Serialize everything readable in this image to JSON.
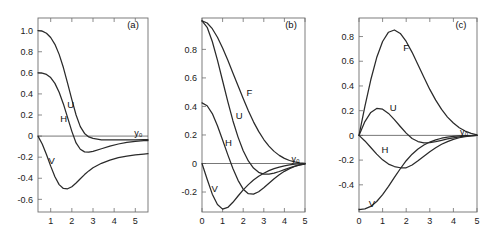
{
  "figure": {
    "background": "#ffffff",
    "curve_color": "#2a2a2a",
    "axis_color": "#6f6f6f",
    "asymptote_label": "y₀"
  },
  "chart_data": [
    {
      "type": "line",
      "panel_tag": "(a)",
      "title": "",
      "xlabel": "",
      "ylabel": "",
      "xlim": [
        0.4,
        5.6
      ],
      "ylim": [
        -0.72,
        1.12
      ],
      "grid": false,
      "legend": "inline-labels",
      "xticks": [
        1,
        2,
        3,
        4,
        5
      ],
      "xticklabels": [
        "1",
        "2",
        "3",
        "4",
        "5"
      ],
      "yticks": [
        1.0,
        0.8,
        0.6,
        0.4,
        0.2,
        0.0,
        -0.2,
        -0.4,
        -0.6
      ],
      "yticklabels": [
        "1.0",
        "0.8",
        "0.6",
        "0.4",
        "0.2",
        "0",
        "-0.2",
        "-0.4",
        "-0.6"
      ],
      "annotations": [
        {
          "text": "U",
          "x": 1.95,
          "y": 0.3
        },
        {
          "text": "H",
          "x": 1.62,
          "y": 0.17
        },
        {
          "text": "V",
          "x": 1.05,
          "y": -0.23
        },
        {
          "text": "y₀",
          "x": 5.15,
          "y": 0.035
        }
      ],
      "series": [
        {
          "name": "U",
          "x": [
            0.4,
            0.6,
            0.8,
            1.0,
            1.2,
            1.4,
            1.6,
            1.8,
            2.0,
            2.2,
            2.4,
            2.6,
            2.8,
            3.0,
            3.4,
            3.8,
            4.2,
            4.6,
            5.0,
            5.4,
            5.6
          ],
          "y": [
            1.0,
            0.995,
            0.975,
            0.935,
            0.87,
            0.775,
            0.65,
            0.5,
            0.345,
            0.2,
            0.09,
            0.025,
            -0.008,
            -0.022,
            -0.035,
            -0.037,
            -0.037,
            -0.036,
            -0.035,
            -0.034,
            -0.034
          ]
        },
        {
          "name": "H",
          "x": [
            0.4,
            0.6,
            0.8,
            1.0,
            1.2,
            1.4,
            1.6,
            1.8,
            2.0,
            2.2,
            2.4,
            2.6,
            2.8,
            3.0,
            3.4,
            3.8,
            4.2,
            4.6,
            5.0,
            5.4,
            5.6
          ],
          "y": [
            0.6,
            0.598,
            0.585,
            0.555,
            0.5,
            0.415,
            0.305,
            0.175,
            0.045,
            -0.065,
            -0.125,
            -0.15,
            -0.152,
            -0.145,
            -0.12,
            -0.095,
            -0.075,
            -0.06,
            -0.05,
            -0.044,
            -0.042
          ]
        },
        {
          "name": "V",
          "x": [
            0.4,
            0.6,
            0.8,
            1.0,
            1.2,
            1.4,
            1.6,
            1.8,
            2.0,
            2.2,
            2.4,
            2.6,
            2.8,
            3.0,
            3.4,
            3.8,
            4.2,
            4.6,
            5.0,
            5.4,
            5.6
          ],
          "y": [
            0.0,
            -0.075,
            -0.175,
            -0.285,
            -0.385,
            -0.46,
            -0.497,
            -0.5,
            -0.48,
            -0.445,
            -0.405,
            -0.365,
            -0.33,
            -0.3,
            -0.258,
            -0.228,
            -0.205,
            -0.19,
            -0.178,
            -0.17,
            -0.167
          ]
        }
      ]
    },
    {
      "type": "line",
      "panel_tag": "(b)",
      "title": "",
      "xlabel": "",
      "ylabel": "",
      "xlim": [
        0.0,
        5.0
      ],
      "ylim": [
        -0.34,
        1.02
      ],
      "grid": false,
      "legend": "inline-labels",
      "xticks": [
        0,
        1,
        2,
        3,
        4,
        5
      ],
      "xticklabels": [
        "0",
        "1",
        "2",
        "3",
        "4",
        "5"
      ],
      "yticks": [
        0.8,
        0.6,
        0.4,
        0.2,
        0.0,
        -0.2
      ],
      "yticklabels": [
        "0.8",
        "0.6",
        "0.4",
        "0.2",
        "0",
        "-0.2"
      ],
      "annotations": [
        {
          "text": "F",
          "x": 2.3,
          "y": 0.5
        },
        {
          "text": "U",
          "x": 1.8,
          "y": 0.335
        },
        {
          "text": "H",
          "x": 1.28,
          "y": 0.145
        },
        {
          "text": "V",
          "x": 0.62,
          "y": -0.175
        },
        {
          "text": "y₀",
          "x": 4.55,
          "y": 0.035
        }
      ],
      "series": [
        {
          "name": "F",
          "x": [
            0.0,
            0.25,
            0.5,
            0.75,
            1.0,
            1.25,
            1.5,
            1.75,
            2.0,
            2.25,
            2.5,
            2.75,
            3.0,
            3.25,
            3.5,
            3.75,
            4.0,
            4.25,
            4.5,
            4.75,
            5.0
          ],
          "y": [
            1.0,
            0.985,
            0.945,
            0.885,
            0.81,
            0.725,
            0.635,
            0.545,
            0.455,
            0.37,
            0.292,
            0.225,
            0.168,
            0.122,
            0.085,
            0.057,
            0.036,
            0.021,
            0.011,
            0.005,
            0.001
          ]
        },
        {
          "name": "U",
          "x": [
            0.0,
            0.25,
            0.5,
            0.75,
            1.0,
            1.25,
            1.5,
            1.75,
            2.0,
            2.25,
            2.5,
            2.75,
            3.0,
            3.25,
            3.5,
            3.75,
            4.0,
            4.25,
            4.5,
            4.75,
            5.0
          ],
          "y": [
            1.0,
            0.955,
            0.855,
            0.725,
            0.58,
            0.435,
            0.3,
            0.185,
            0.09,
            0.018,
            -0.032,
            -0.062,
            -0.075,
            -0.075,
            -0.068,
            -0.056,
            -0.043,
            -0.03,
            -0.019,
            -0.01,
            -0.004
          ]
        },
        {
          "name": "H",
          "x": [
            0.0,
            0.25,
            0.5,
            0.75,
            1.0,
            1.25,
            1.5,
            1.75,
            2.0,
            2.25,
            2.5,
            2.75,
            3.0,
            3.25,
            3.5,
            3.75,
            4.0,
            4.25,
            4.5,
            4.75,
            5.0
          ],
          "y": [
            0.425,
            0.405,
            0.35,
            0.265,
            0.165,
            0.062,
            -0.035,
            -0.118,
            -0.18,
            -0.212,
            -0.215,
            -0.198,
            -0.17,
            -0.138,
            -0.107,
            -0.079,
            -0.055,
            -0.036,
            -0.021,
            -0.01,
            -0.003
          ]
        },
        {
          "name": "V",
          "x": [
            0.0,
            0.25,
            0.5,
            0.75,
            1.0,
            1.25,
            1.5,
            1.75,
            2.0,
            2.25,
            2.5,
            2.75,
            3.0,
            3.25,
            3.5,
            3.75,
            4.0,
            4.25,
            4.5,
            4.75,
            5.0
          ],
          "y": [
            0.0,
            -0.11,
            -0.215,
            -0.288,
            -0.32,
            -0.308,
            -0.272,
            -0.228,
            -0.185,
            -0.148,
            -0.116,
            -0.09,
            -0.068,
            -0.05,
            -0.036,
            -0.025,
            -0.016,
            -0.01,
            -0.005,
            -0.002,
            0.0
          ]
        }
      ]
    },
    {
      "type": "line",
      "panel_tag": "(c)",
      "title": "",
      "xlabel": "",
      "ylabel": "",
      "xlim": [
        0.0,
        5.0
      ],
      "ylim": [
        -0.62,
        0.95
      ],
      "grid": false,
      "legend": "inline-labels",
      "xticks": [
        0,
        1,
        2,
        3,
        4,
        5
      ],
      "xticklabels": [
        "0",
        "1",
        "2",
        "3",
        "4",
        "5"
      ],
      "yticks": [
        0.8,
        0.6,
        0.4,
        0.2,
        0.0,
        -0.2,
        -0.4
      ],
      "yticklabels": [
        "0.8",
        "0.6",
        "0.4",
        "0.2",
        "0",
        "-0.2",
        "-0.4"
      ],
      "annotations": [
        {
          "text": "F",
          "x": 2.0,
          "y": 0.715
        },
        {
          "text": "U",
          "x": 1.45,
          "y": 0.225
        },
        {
          "text": "H",
          "x": 1.1,
          "y": -0.115
        },
        {
          "text": "V",
          "x": 0.55,
          "y": -0.555
        },
        {
          "text": "y₀",
          "x": 4.45,
          "y": 0.035
        }
      ],
      "series": [
        {
          "name": "F",
          "x": [
            0.0,
            0.25,
            0.5,
            0.75,
            1.0,
            1.25,
            1.5,
            1.75,
            2.0,
            2.25,
            2.5,
            2.75,
            3.0,
            3.25,
            3.5,
            3.75,
            4.0,
            4.25,
            4.5,
            4.75,
            5.0
          ],
          "y": [
            0.0,
            0.235,
            0.45,
            0.63,
            0.76,
            0.835,
            0.853,
            0.825,
            0.76,
            0.672,
            0.572,
            0.47,
            0.372,
            0.285,
            0.21,
            0.148,
            0.1,
            0.062,
            0.035,
            0.016,
            0.004
          ]
        },
        {
          "name": "U",
          "x": [
            0.0,
            0.25,
            0.5,
            0.75,
            1.0,
            1.25,
            1.5,
            1.75,
            2.0,
            2.25,
            2.5,
            2.75,
            3.0,
            3.25,
            3.5,
            3.75,
            4.0,
            4.25,
            4.5,
            4.75,
            5.0
          ],
          "y": [
            0.0,
            0.112,
            0.186,
            0.218,
            0.212,
            0.178,
            0.128,
            0.072,
            0.018,
            -0.025,
            -0.05,
            -0.06,
            -0.058,
            -0.05,
            -0.04,
            -0.029,
            -0.02,
            -0.012,
            -0.006,
            -0.002,
            0.0
          ]
        },
        {
          "name": "H",
          "x": [
            0.0,
            0.25,
            0.5,
            0.75,
            1.0,
            1.25,
            1.5,
            1.75,
            2.0,
            2.25,
            2.5,
            2.75,
            3.0,
            3.25,
            3.5,
            3.75,
            4.0,
            4.25,
            4.5,
            4.75,
            5.0
          ],
          "y": [
            0.0,
            -0.045,
            -0.098,
            -0.152,
            -0.198,
            -0.232,
            -0.252,
            -0.262,
            -0.262,
            -0.24,
            -0.205,
            -0.168,
            -0.132,
            -0.1,
            -0.072,
            -0.05,
            -0.032,
            -0.019,
            -0.01,
            -0.004,
            0.0
          ]
        },
        {
          "name": "V",
          "x": [
            0.0,
            0.25,
            0.5,
            0.75,
            1.0,
            1.25,
            1.5,
            1.75,
            2.0,
            2.25,
            2.5,
            2.75,
            3.0,
            3.25,
            3.5,
            3.75,
            4.0,
            4.25,
            4.5,
            4.75,
            5.0
          ],
          "y": [
            -0.6,
            -0.595,
            -0.575,
            -0.535,
            -0.48,
            -0.412,
            -0.34,
            -0.27,
            -0.205,
            -0.152,
            -0.11,
            -0.078,
            -0.054,
            -0.036,
            -0.023,
            -0.014,
            -0.008,
            -0.004,
            -0.002,
            -0.001,
            0.0
          ]
        }
      ]
    }
  ]
}
